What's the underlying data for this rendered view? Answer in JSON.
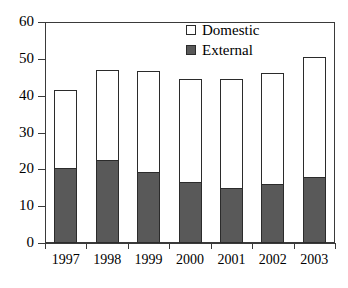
{
  "chart_data": {
    "type": "bar",
    "subtype": "stacked-column",
    "title": "",
    "subtitle": "",
    "xlabel": "",
    "ylabel": "",
    "categories": [
      "1997",
      "1998",
      "1999",
      "2000",
      "2001",
      "2002",
      "2003"
    ],
    "series": [
      {
        "name": "External",
        "color": "#595959",
        "values": [
          20.4,
          22.6,
          19.3,
          16.5,
          14.9,
          16.1,
          18.0
        ]
      },
      {
        "name": "Domestic",
        "color": "#ffffff",
        "values": [
          21.2,
          24.3,
          27.3,
          27.9,
          29.5,
          30.0,
          32.6
        ]
      }
    ],
    "totals": [
      41.6,
      46.9,
      46.6,
      44.4,
      44.4,
      46.1,
      50.6
    ],
    "ylim": [
      0,
      60
    ],
    "yticks": [
      0,
      10,
      20,
      30,
      40,
      50,
      60
    ],
    "ytick_labels": [
      "0",
      "10",
      "20",
      "30",
      "40",
      "50",
      "60"
    ],
    "grid": false,
    "legend": {
      "position": "top-center-right",
      "entries": [
        {
          "label": "Domestic",
          "swatch": "hollow-square-icon",
          "color": "#ffffff"
        },
        {
          "label": "External",
          "swatch": "filled-square-icon",
          "color": "#595959"
        }
      ]
    },
    "axis_color": "#3a3a3a",
    "bar_border_color": "#2b2b2b",
    "background": "#ffffff"
  }
}
